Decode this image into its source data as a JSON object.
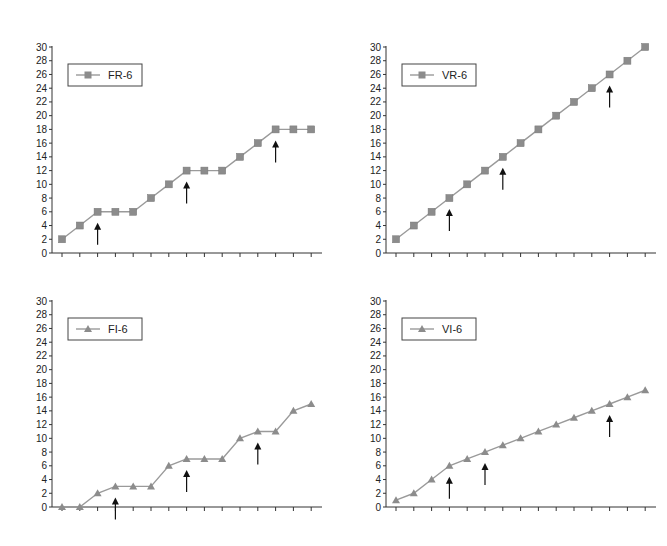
{
  "chart_data": [
    {
      "type": "line",
      "title": "",
      "legend": "FR-6",
      "marker": "square",
      "xlabel": "",
      "ylabel": "",
      "ylim": [
        0,
        30
      ],
      "yticks": [
        0,
        2,
        4,
        6,
        8,
        10,
        12,
        14,
        16,
        18,
        20,
        22,
        24,
        26,
        28,
        30
      ],
      "x": [
        1,
        2,
        3,
        4,
        5,
        6,
        7,
        8,
        9,
        10,
        11,
        12,
        13,
        14,
        15
      ],
      "values": [
        2,
        4,
        6,
        6,
        6,
        8,
        10,
        12,
        12,
        12,
        14,
        16,
        18,
        18,
        18
      ],
      "arrows_at": [
        3,
        8,
        13
      ],
      "grid": false,
      "legend_position": "upper-left"
    },
    {
      "type": "line",
      "title": "",
      "legend": "VR-6",
      "marker": "square",
      "xlabel": "",
      "ylabel": "",
      "ylim": [
        0,
        30
      ],
      "yticks": [
        0,
        2,
        4,
        6,
        8,
        10,
        12,
        14,
        16,
        18,
        20,
        22,
        24,
        26,
        28,
        30
      ],
      "x": [
        1,
        2,
        3,
        4,
        5,
        6,
        7,
        8,
        9,
        10,
        11,
        12,
        13,
        14,
        15
      ],
      "values": [
        2,
        4,
        6,
        8,
        10,
        12,
        14,
        16,
        18,
        20,
        22,
        24,
        26,
        28,
        30
      ],
      "arrows_at": [
        4,
        7,
        13
      ],
      "grid": false,
      "legend_position": "upper-left"
    },
    {
      "type": "line",
      "title": "",
      "legend": "FI-6",
      "marker": "triangle",
      "xlabel": "",
      "ylabel": "",
      "ylim": [
        0,
        30
      ],
      "yticks": [
        0,
        2,
        4,
        6,
        8,
        10,
        12,
        14,
        16,
        18,
        20,
        22,
        24,
        26,
        28,
        30
      ],
      "x": [
        1,
        2,
        3,
        4,
        5,
        6,
        7,
        8,
        9,
        10,
        11,
        12,
        13,
        14,
        15
      ],
      "values": [
        0,
        0,
        2,
        3,
        3,
        3,
        6,
        7,
        7,
        7,
        10,
        11,
        11,
        14,
        15
      ],
      "arrows_at": [
        4,
        8,
        12
      ],
      "grid": false,
      "legend_position": "upper-left"
    },
    {
      "type": "line",
      "title": "",
      "legend": "VI-6",
      "marker": "triangle",
      "xlabel": "",
      "ylabel": "",
      "ylim": [
        0,
        30
      ],
      "yticks": [
        0,
        2,
        4,
        6,
        8,
        10,
        12,
        14,
        16,
        18,
        20,
        22,
        24,
        26,
        28,
        30
      ],
      "x": [
        1,
        2,
        3,
        4,
        5,
        6,
        7,
        8,
        9,
        10,
        11,
        12,
        13,
        14,
        15
      ],
      "values": [
        1,
        2,
        4,
        6,
        7,
        8,
        9,
        10,
        11,
        12,
        13,
        14,
        15,
        16,
        17
      ],
      "arrows_at": [
        4,
        6,
        13
      ],
      "grid": false,
      "legend_position": "upper-left"
    }
  ],
  "style": {
    "line_color": "#9a9a9a",
    "marker_color": "#8c8c8c",
    "axis_color": "#333333",
    "arrow_color": "#111111",
    "legend_border": "#444444"
  },
  "layout": {
    "panels": [
      {
        "left": 0,
        "top": 0
      },
      {
        "left": 334,
        "top": 0
      },
      {
        "left": 0,
        "top": 254
      },
      {
        "left": 334,
        "top": 254
      }
    ]
  }
}
